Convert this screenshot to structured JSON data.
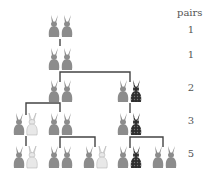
{
  "diagram": {
    "column_header": "pairs",
    "rows": [
      {
        "generation": 1,
        "pairs": "1",
        "label_y": 30
      },
      {
        "generation": 2,
        "pairs": "1",
        "label_y": 55
      },
      {
        "generation": 3,
        "pairs": "2",
        "label_y": 88
      },
      {
        "generation": 4,
        "pairs": "3",
        "label_y": 121
      },
      {
        "generation": 5,
        "pairs": "5",
        "label_y": 154
      }
    ],
    "rabbit_pairs": [
      {
        "row": 1,
        "x": 48,
        "y": 15,
        "left": "grey",
        "right": "grey"
      },
      {
        "row": 2,
        "x": 48,
        "y": 48,
        "left": "grey",
        "right": "grey"
      },
      {
        "row": 3,
        "x": 48,
        "y": 80,
        "left": "grey",
        "right": "grey"
      },
      {
        "row": 3,
        "x": 117,
        "y": 80,
        "left": "grey",
        "right": "dark"
      },
      {
        "row": 4,
        "x": 13,
        "y": 113,
        "left": "grey",
        "right": "white"
      },
      {
        "row": 4,
        "x": 48,
        "y": 113,
        "left": "grey",
        "right": "grey"
      },
      {
        "row": 4,
        "x": 117,
        "y": 113,
        "left": "grey",
        "right": "dark"
      },
      {
        "row": 5,
        "x": 13,
        "y": 146,
        "left": "grey",
        "right": "white"
      },
      {
        "row": 5,
        "x": 48,
        "y": 146,
        "left": "grey",
        "right": "grey"
      },
      {
        "row": 5,
        "x": 83,
        "y": 146,
        "left": "grey",
        "right": "white"
      },
      {
        "row": 5,
        "x": 117,
        "y": 146,
        "left": "grey",
        "right": "dark"
      },
      {
        "row": 5,
        "x": 152,
        "y": 146,
        "left": "grey",
        "right": "grey"
      }
    ],
    "colors": {
      "grey": "#8c8c8c",
      "dark": "#3a3a3a",
      "white": "#e8e8e8",
      "line": "#444444",
      "text": "#555555"
    }
  }
}
